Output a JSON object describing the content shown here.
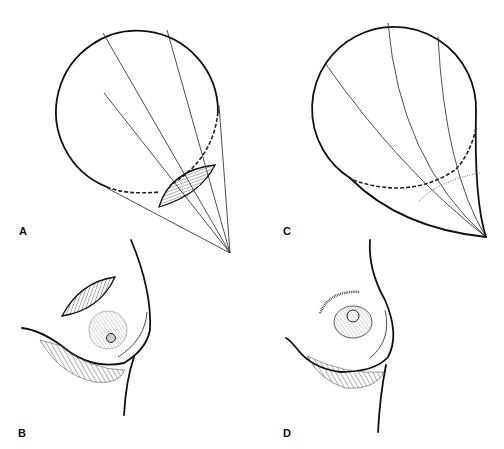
{
  "figure": {
    "panels": [
      {
        "id": "A",
        "label": "A",
        "description": "Breast cone schematic with lens-shaped excision (hatched) at lower outer region; radiating lines to apex; dashed inframammary line"
      },
      {
        "id": "B",
        "label": "B",
        "description": "Breast profile with hatched crescent excision above areola and hatched inframammary region"
      },
      {
        "id": "C",
        "label": "C",
        "description": "Breast cone schematic after closure; curved radiating lines; dashed and dotted closure lines"
      },
      {
        "id": "D",
        "label": "D",
        "description": "Breast profile after closure with scar line above areola and hatched inframammary region"
      }
    ]
  },
  "colors": {
    "ink": "#111111",
    "background": "#ffffff"
  }
}
